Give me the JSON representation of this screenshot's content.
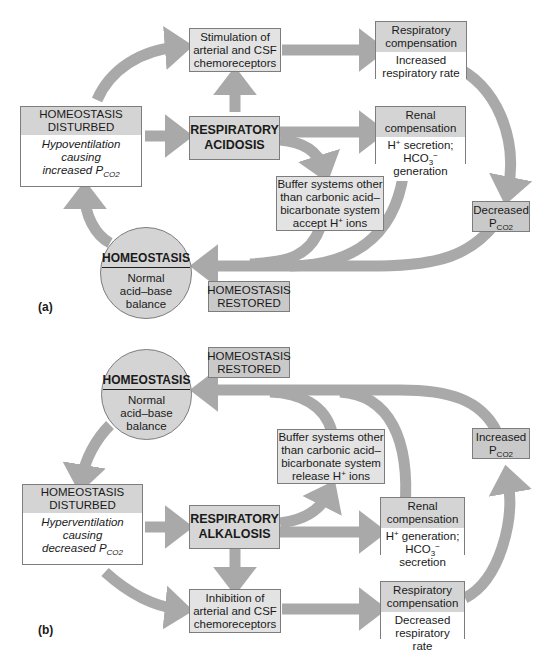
{
  "panel_a": {
    "label": "(a)",
    "disturbed": {
      "title": "HOMEOSTASIS DISTURBED",
      "body_line1": "Hypoventilation",
      "body_line2": "causing",
      "body_line3": "increased P",
      "body_sub": "CO2"
    },
    "condition": {
      "line1": "RESPIRATORY",
      "line2": "ACIDOSIS"
    },
    "chemoreceptors": {
      "line1": "Stimulation of",
      "line2": "arterial and CSF",
      "line3": "chemoreceptors"
    },
    "respiratory_compensation": {
      "title_line1": "Respiratory",
      "title_line2": "compensation",
      "body_line1": "Increased",
      "body_line2": "respiratory rate"
    },
    "renal_compensation": {
      "title_line1": "Renal",
      "title_line2": "compensation",
      "body_line1a": "H",
      "body_line1_sup": "+",
      "body_line1b": " secretion;",
      "body_line2a": "HCO",
      "body_line2_sub": "3",
      "body_line2_sup": "−",
      "body_line2b": " generation"
    },
    "buffer": {
      "line1": "Buffer systems other",
      "line2": "than carbonic acid–",
      "line3": "bicarbonate system",
      "line4a": "accept H",
      "line4_sup": "+",
      "line4b": " ions"
    },
    "pco2_result": {
      "line1": "Decreased",
      "line2": "P",
      "line2_sub": "CO2"
    },
    "homeostasis": {
      "title": "HOMEOSTASIS",
      "line1": "Normal",
      "line2": "acid–base",
      "line3": "balance"
    },
    "restored": {
      "line1": "HOMEOSTASIS",
      "line2": "RESTORED"
    }
  },
  "panel_b": {
    "label": "(b)",
    "disturbed": {
      "title": "HOMEOSTASIS DISTURBED",
      "body_line1": "Hyperventilation",
      "body_line2": "causing",
      "body_line3": "decreased P",
      "body_sub": "CO2"
    },
    "condition": {
      "line1": "RESPIRATORY",
      "line2": "ALKALOSIS"
    },
    "chemoreceptors": {
      "line1": "Inhibition of",
      "line2": "arterial and CSF",
      "line3": "chemoreceptors"
    },
    "respiratory_compensation": {
      "title_line1": "Respiratory",
      "title_line2": "compensation",
      "body_line1": "Decreased",
      "body_line2": "respiratory rate"
    },
    "renal_compensation": {
      "title_line1": "Renal",
      "title_line2": "compensation",
      "body_line1a": "H",
      "body_line1_sup": "+",
      "body_line1b": " generation;",
      "body_line2a": "HCO",
      "body_line2_sub": "3",
      "body_line2_sup": "−",
      "body_line2b": " secretion"
    },
    "buffer": {
      "line1": "Buffer systems other",
      "line2": "than carbonic acid–",
      "line3": "bicarbonate system",
      "line4a": "release H",
      "line4_sup": "+",
      "line4b": " ions"
    },
    "pco2_result": {
      "line1": "Increased",
      "line2": "P",
      "line2_sub": "CO2"
    },
    "homeostasis": {
      "title": "HOMEOSTASIS",
      "line1": "Normal",
      "line2": "acid–base",
      "line3": "balance"
    },
    "restored": {
      "line1": "HOMEOSTASIS",
      "line2": "RESTORED"
    }
  },
  "colors": {
    "arrow": "#a9a9a9",
    "box_border": "#7d7d7d",
    "box_fill": "#d4d4d4",
    "background": "#ffffff"
  }
}
